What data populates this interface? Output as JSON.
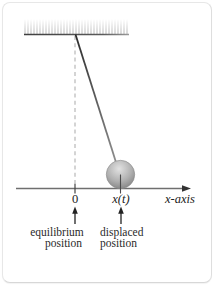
{
  "figure": {
    "type": "pendulum-on-x-axis-diagram",
    "labels": {
      "origin": "0",
      "displacement": "x(t)",
      "axis": "x-axis"
    },
    "annotations": {
      "equilibrium_line1": "equilibrium",
      "equilibrium_line2": "position",
      "displaced_line1": "displaced",
      "displaced_line2": "position"
    },
    "elements": {
      "ceiling": "hatched-ceiling-mount",
      "rod": "pendulum-rod",
      "ball": "pendulum-bob",
      "dashed_line": "equilibrium-vertical-reference",
      "axis": "horizontal-x-axis-with-right-arrow"
    },
    "colors": {
      "text": "#222222",
      "axis_line": "#6f6f6f",
      "arrowhead": "#333333",
      "rod_dark": "#2c2c2c",
      "rod_light": "#909090",
      "dashed_line": "#bdbdbd",
      "ceiling_hatch": "#c4c4c4",
      "ceiling_edge_dark": "#3f3f3f",
      "ceiling_edge_light": "#9a9a9a",
      "ball_highlight": "#e2e2e2",
      "ball_mid": "#b0b0b0",
      "ball_shadow": "#7a7a7a",
      "card_border": "#e7e7e7",
      "background": "#ffffff"
    }
  }
}
